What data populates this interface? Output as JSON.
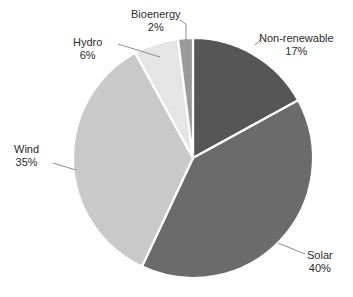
{
  "chart_data": {
    "type": "pie",
    "title": "",
    "subtitle": "",
    "xlabel": "",
    "ylabel": "",
    "legend_position": "none",
    "grid": false,
    "labels_format": "name-and-percent-callouts",
    "start_angle_deg": 0,
    "direction": "clockwise",
    "categories": [
      "Non-renewable",
      "Solar",
      "Wind",
      "Hydro",
      "Bioenergy"
    ],
    "values": [
      17,
      40,
      35,
      6,
      2
    ],
    "units": "%",
    "total": 100,
    "slices": [
      {
        "name": "Non-renewable",
        "value": 17,
        "label": "Non-renewable",
        "percent_text": "17%",
        "color": "#565656",
        "start_deg": 0,
        "end_deg": 61.2
      },
      {
        "name": "Solar",
        "value": 40,
        "label": "Solar",
        "percent_text": "40%",
        "color": "#6b6b6b",
        "start_deg": 61.2,
        "end_deg": 205.2
      },
      {
        "name": "Wind",
        "value": 35,
        "label": "Wind",
        "percent_text": "35%",
        "color": "#c9c9c9",
        "start_deg": 205.2,
        "end_deg": 331.2
      },
      {
        "name": "Hydro",
        "value": 6,
        "label": "Hydro",
        "percent_text": "6%",
        "color": "#e5e5e5",
        "start_deg": 331.2,
        "end_deg": 352.8
      },
      {
        "name": "Bioenergy",
        "value": 2,
        "label": "Bioenergy",
        "percent_text": "2%",
        "color": "#9b9b9b",
        "start_deg": 352.8,
        "end_deg": 360
      }
    ],
    "geometry": {
      "center_x": 193,
      "center_y": 158,
      "radius": 120
    },
    "style": {
      "background": "#ffffff",
      "slice_border": "#ffffff",
      "leader_line": "#8d8d8d",
      "text": "#2b2b2b"
    }
  }
}
